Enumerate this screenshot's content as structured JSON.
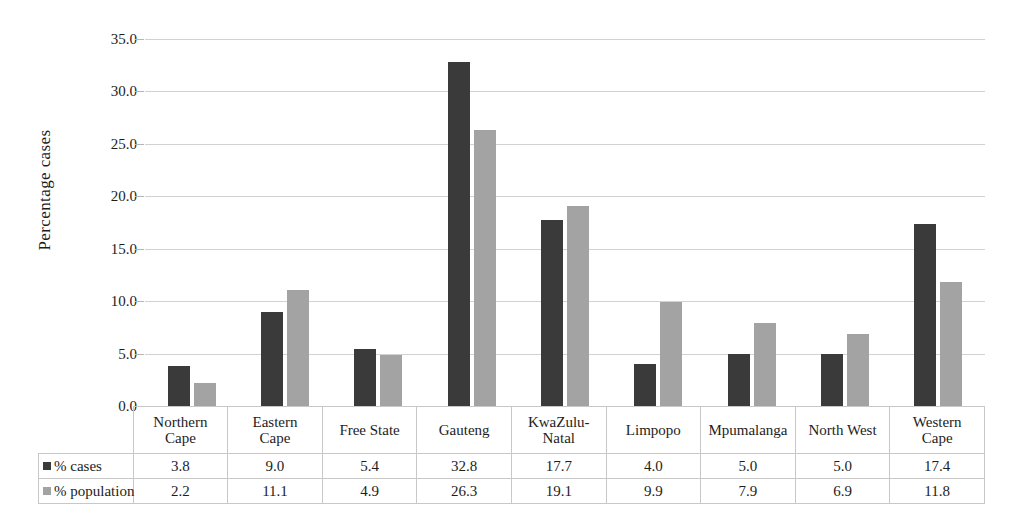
{
  "chart_data": {
    "type": "bar",
    "title": "",
    "xlabel": "",
    "ylabel": "Percentage cases",
    "ylim": [
      0,
      35
    ],
    "ytick_labels": [
      "35.0",
      "30.0",
      "25.0",
      "20.0",
      "15.0",
      "10.0",
      "5.0",
      "0.0"
    ],
    "ytick_values": [
      35,
      30,
      25,
      20,
      15,
      10,
      5,
      0
    ],
    "grid": true,
    "legend_position": "table",
    "categories": [
      "Northern Cape",
      "Eastern Cape",
      "Free State",
      "Gauteng",
      "KwaZulu-Natal",
      "Limpopo",
      "Mpumalanga",
      "North West",
      "Western Cape"
    ],
    "category_lines": [
      [
        "Northern",
        "Cape"
      ],
      [
        "Eastern",
        "Cape"
      ],
      [
        "Free State",
        ""
      ],
      [
        "Gauteng",
        ""
      ],
      [
        "KwaZulu-",
        "Natal"
      ],
      [
        "Limpopo",
        ""
      ],
      [
        "Mpumalanga",
        ""
      ],
      [
        "North West",
        ""
      ],
      [
        "Western",
        "Cape"
      ]
    ],
    "series": [
      {
        "name": "% cases",
        "color": "#3a3a3a",
        "values": [
          3.8,
          9.0,
          5.4,
          32.8,
          17.7,
          4.0,
          5.0,
          5.0,
          17.4
        ],
        "labels": [
          "3.8",
          "9.0",
          "5.4",
          "32.8",
          "17.7",
          "4.0",
          "5.0",
          "5.0",
          "17.4"
        ]
      },
      {
        "name": "% population",
        "color": "#a3a3a3",
        "values": [
          2.2,
          11.1,
          4.9,
          26.3,
          19.1,
          9.9,
          7.9,
          6.9,
          11.8
        ],
        "labels": [
          "2.2",
          "11.1",
          "4.9",
          "26.3",
          "19.1",
          "9.9",
          "7.9",
          "6.9",
          "11.8"
        ]
      }
    ]
  },
  "colors": {
    "cases": "#3a3a3a",
    "population": "#a3a3a3",
    "gridline": "#d2d2d2",
    "border": "#c8c8c8",
    "background": "#ffffff"
  }
}
